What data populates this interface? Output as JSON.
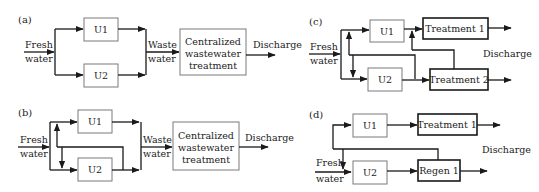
{
  "panels": {
    "a": {
      "label": "(a)",
      "fresh_water": [
        "Fresh",
        "water"
      ],
      "unit1": "U1",
      "unit2": "U2",
      "waste_water": [
        "Waste",
        "water"
      ],
      "treatment": [
        "Centralized",
        "wastewater",
        "treatment"
      ],
      "discharge": "Discharge"
    },
    "b": {
      "label": "(b)",
      "fresh_water": [
        "Fresh",
        "water"
      ],
      "unit1": "U1",
      "unit2": "U2",
      "waste_water": [
        "Waste",
        "water"
      ],
      "treatment": [
        "Centralized",
        "wastewater",
        "treatment"
      ],
      "discharge": "Discharge"
    },
    "c": {
      "label": "(c)",
      "fresh_water": [
        "Fresh",
        "water"
      ],
      "unit1": "U1",
      "unit2": "U2",
      "treatment1": "Treatment 1",
      "treatment2": "Treatment 2",
      "discharge": "Discharge"
    },
    "d": {
      "label": "(d)",
      "fresh_water": [
        "Fresh",
        "water"
      ],
      "unit1": "U1",
      "unit2": "U2",
      "treatment1": "Treatment 1",
      "regen1": "Regen 1",
      "discharge": "Discharge"
    }
  }
}
